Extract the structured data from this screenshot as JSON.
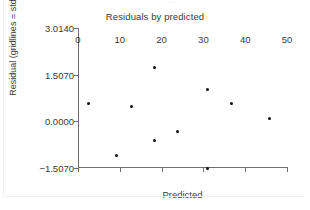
{
  "clipped_top_text": "...",
  "chart_data": {
    "type": "scatter",
    "title": "Residuals by predicted",
    "xlabel": "Predicted",
    "ylabel": "Residual (gridlines = std. error)",
    "xlim": [
      0,
      50
    ],
    "ylim": [
      -1.507,
      3.014
    ],
    "grid": false,
    "legend": null,
    "xticks": [
      0,
      10,
      20,
      30,
      40,
      50
    ],
    "xtick_labels": [
      "0",
      "10",
      "20",
      "30",
      "40",
      "50"
    ],
    "yticks": [
      3.014,
      1.507,
      0.0,
      -1.507
    ],
    "ytick_labels": [
      "3.0140",
      "1.5070",
      "0.0000",
      "−1.5070"
    ],
    "marker_color": "#101010",
    "axis_color": "#6f6f6f",
    "text_color": "#3a3a3a",
    "points": [
      {
        "x": 2.4,
        "y": 0.58
      },
      {
        "x": 9.3,
        "y": -1.09
      },
      {
        "x": 12.7,
        "y": 0.48
      },
      {
        "x": 18.4,
        "y": 1.74
      },
      {
        "x": 18.4,
        "y": -0.61
      },
      {
        "x": 23.9,
        "y": -0.32
      },
      {
        "x": 30.9,
        "y": -1.51
      },
      {
        "x": 31.1,
        "y": 1.03
      },
      {
        "x": 36.8,
        "y": 0.58
      },
      {
        "x": 45.9,
        "y": 0.1
      }
    ]
  }
}
